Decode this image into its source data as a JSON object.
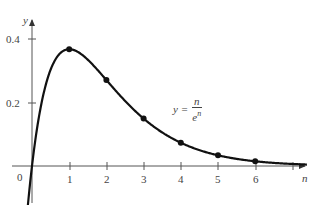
{
  "chart_data": {
    "type": "line",
    "title": "",
    "xlabel": "n",
    "ylabel": "y",
    "function": "y = n / e^n",
    "annotation": {
      "lhs": "y =",
      "numerator": "n",
      "denominator": "e",
      "exponent": "n"
    },
    "x_ticks": [
      "1",
      "2",
      "3",
      "4",
      "5",
      "6"
    ],
    "y_ticks": [
      "0.2",
      "0.4"
    ],
    "origin_label": "0",
    "xlim": [
      -0.5,
      7.5
    ],
    "ylim": [
      -0.12,
      0.45
    ],
    "grid": false,
    "points": {
      "x": [
        1,
        2,
        3,
        4,
        5,
        6
      ],
      "y": [
        0.368,
        0.271,
        0.149,
        0.073,
        0.034,
        0.015
      ]
    },
    "curve_color": "#111111"
  },
  "labels": {
    "y_axis": "y",
    "x_axis": "n",
    "origin": "0",
    "y_0_2": "0.2",
    "y_0_4": "0.4",
    "x1": "1",
    "x2": "2",
    "x3": "3",
    "x4": "4",
    "x5": "5",
    "x6": "6",
    "f_lhs": "y =",
    "f_num": "n",
    "f_den": "e",
    "f_exp": "n"
  }
}
